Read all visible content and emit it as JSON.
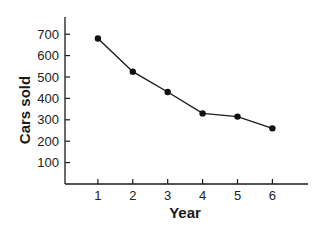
{
  "chart_data": {
    "type": "line",
    "title": "",
    "xlabel": "Year",
    "ylabel": "Cars sold",
    "x": [
      1,
      2,
      3,
      4,
      5,
      6
    ],
    "categories": [
      "1",
      "2",
      "3",
      "4",
      "5",
      "6"
    ],
    "values": [
      680,
      525,
      430,
      330,
      315,
      260
    ],
    "series": [
      {
        "name": "Cars sold",
        "values": [
          680,
          525,
          430,
          330,
          315,
          260
        ]
      }
    ],
    "yticks": [
      100,
      200,
      300,
      400,
      500,
      600,
      700
    ],
    "ytick_labels": [
      "100",
      "200",
      "300",
      "400",
      "500",
      "600",
      "700"
    ],
    "ylim": [
      0,
      800
    ],
    "xlim": [
      0,
      7
    ],
    "grid": false,
    "legend": null,
    "colors": {
      "line": "#1a1a1a",
      "marker": "#111111",
      "axis": "#1a1a1a"
    }
  }
}
